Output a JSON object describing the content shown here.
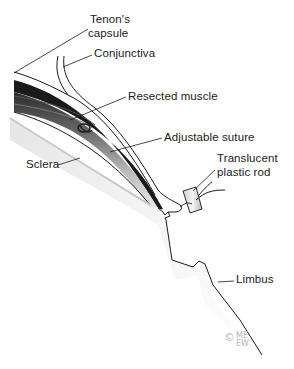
{
  "figure": {
    "type": "surgical illustration"
  },
  "labels": {
    "tenons_capsule_line1": "Tenon's",
    "tenons_capsule_line2": "capsule",
    "conjunctiva": "Conjunctiva",
    "resected_muscle": "Resected muscle",
    "adjustable_suture": "Adjustable suture",
    "sclera": "Sclera",
    "translucent_plastic_rod_line1": "Translucent",
    "translucent_plastic_rod_line2": "plastic rod",
    "limbus": "Limbus"
  },
  "copyright": {
    "symbol": "©",
    "mark_line1": "ME",
    "mark_line2": "EW"
  },
  "colors": {
    "line": "#1a1a1a",
    "shade_dark": "#3a3a3a",
    "shade_mid": "#8a8a8a",
    "shade_light": "#d0d0d0",
    "background": "#ffffff"
  }
}
